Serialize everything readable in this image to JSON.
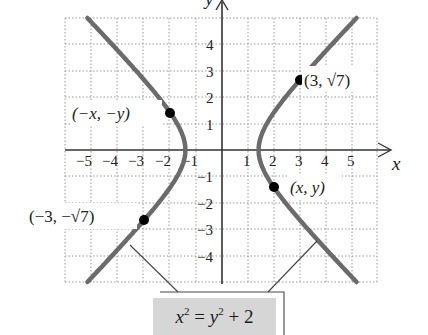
{
  "chart_data": {
    "type": "line",
    "title": "",
    "equation": "x^2 = y^2 + 2",
    "equation_display": {
      "lhs_var": "x",
      "lhs_exp": "2",
      "eq": "=",
      "rhs_var": "y",
      "rhs_exp": "2",
      "rhs_rest": "+ 2"
    },
    "xlabel": "x",
    "ylabel": "y",
    "xlim": [
      -6,
      6
    ],
    "ylim": [
      -5,
      5
    ],
    "grid": true,
    "grid_style": "dotted",
    "x_ticks": [
      "-5",
      "-4",
      "-3",
      "-2",
      "-1",
      "1",
      "2",
      "3",
      "4",
      "5"
    ],
    "y_ticks": [
      "4",
      "3",
      "2",
      "1",
      "-1",
      "-2",
      "-3",
      "-4"
    ],
    "series": [
      {
        "name": "right branch",
        "curve": "x = sqrt(y^2 + 2)",
        "y_range": [
          -5,
          5
        ],
        "color": "#6b6b6b"
      },
      {
        "name": "left branch",
        "curve": "x = -sqrt(y^2 + 2)",
        "y_range": [
          -5,
          5
        ],
        "color": "#6b6b6b"
      }
    ],
    "points": [
      {
        "label": "(3, √7)",
        "x": 3,
        "y": 2.646
      },
      {
        "label": "(−x, −y)",
        "x": -2,
        "y": 1.414
      },
      {
        "label": "(x, y)",
        "x": 2,
        "y": -1.414
      },
      {
        "label": "(−3, −√7)",
        "x": -3,
        "y": -2.646
      }
    ],
    "annotations": [
      "x² = y² + 2 (callout pointing to both branches)"
    ]
  },
  "labels": {
    "x_axis": "x",
    "y_axis": "y",
    "pt_right_top": "(3, √7)",
    "pt_left_top": "(−x, −y)",
    "pt_right_bottom": "(x, y)",
    "pt_left_bottom": "(−3, −√7)"
  },
  "ticks": {
    "x": {
      "m5": "−5",
      "m4": "−4",
      "m3": "−3",
      "m2": "−2",
      "m1": "−1",
      "p1": "1",
      "p2": "2",
      "p3": "3",
      "p4": "4",
      "p5": "5"
    },
    "y": {
      "p4": "4",
      "p3": "3",
      "p2": "2",
      "p1": "1",
      "m1": "−1",
      "m2": "−2",
      "m3": "−3",
      "m4": "−4"
    }
  },
  "colors": {
    "curve": "#6b6b6b",
    "axis": "#333333",
    "grid": "#9a9a9a",
    "point": "#000000",
    "equation_bg": "#d6d6d6"
  }
}
